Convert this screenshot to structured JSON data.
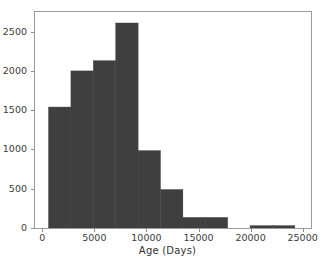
{
  "figure": {
    "background_color": "#ffffff",
    "axes_edge_color": "#9a9a9a",
    "tick_color": "#8c8c8c",
    "text_color": "#3a3a3a",
    "top_fragment_text": "."
  },
  "chart_data": {
    "type": "bar",
    "subtype": "histogram",
    "title": "",
    "xlabel": "Age (Days)",
    "ylabel": "",
    "bar_color": "#3f3f3f",
    "bar_edge_color": "#3f3f3f",
    "grid": false,
    "legend": false,
    "legend_position": "none",
    "xlim": [
      -700,
      25800
    ],
    "ylim": [
      0,
      2750
    ],
    "xticks": [
      0,
      5000,
      10000,
      15000,
      20000,
      25000
    ],
    "xtick_labels": [
      "0",
      "5000",
      "10000",
      "15000",
      "20000",
      "25000"
    ],
    "yticks": [
      0,
      500,
      1000,
      1500,
      2000,
      2500
    ],
    "ytick_labels": [
      "0",
      "500",
      "1000",
      "1500",
      "2000",
      "2500"
    ],
    "bin_edges": [
      600,
      2750,
      4900,
      7050,
      9200,
      11350,
      13500,
      15650,
      17800,
      19950,
      22100,
      24250
    ],
    "values": [
      1540,
      2000,
      2130,
      2610,
      985,
      490,
      135,
      135,
      0,
      30,
      30
    ],
    "bins": [
      {
        "x0": 600,
        "x1": 2750,
        "count": 1540
      },
      {
        "x0": 2750,
        "x1": 4900,
        "count": 2000
      },
      {
        "x0": 4900,
        "x1": 7050,
        "count": 2130
      },
      {
        "x0": 7050,
        "x1": 9200,
        "count": 2610
      },
      {
        "x0": 9200,
        "x1": 11350,
        "count": 985
      },
      {
        "x0": 11350,
        "x1": 13500,
        "count": 490
      },
      {
        "x0": 13500,
        "x1": 15650,
        "count": 135
      },
      {
        "x0": 15650,
        "x1": 17800,
        "count": 135
      },
      {
        "x0": 17800,
        "x1": 19950,
        "count": 0
      },
      {
        "x0": 19950,
        "x1": 22100,
        "count": 30
      },
      {
        "x0": 22100,
        "x1": 24250,
        "count": 30
      }
    ]
  }
}
